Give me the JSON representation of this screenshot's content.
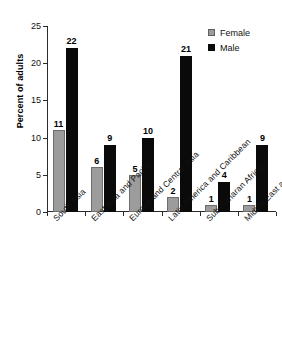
{
  "chart_data": {
    "type": "bar",
    "title": "",
    "xlabel": "",
    "ylabel": "Percent of adults",
    "ylim": [
      0,
      25
    ],
    "yticks": [
      0,
      5,
      10,
      15,
      20,
      25
    ],
    "grid": false,
    "legend_position": "top-right",
    "categories": [
      "South Asia",
      "East Asia and Pacific",
      "Europe and Central Asia",
      "Latin America and Caribbean",
      "Sub-Saharan Africa",
      "Middle East and N. Africa"
    ],
    "series": [
      {
        "name": "Female",
        "color": "#9c9c9c",
        "values": [
          11,
          6,
          5,
          2,
          1,
          1
        ]
      },
      {
        "name": "Male",
        "color": "#0a0a0a",
        "values": [
          22,
          9,
          10,
          21,
          4,
          9
        ]
      }
    ]
  },
  "legend": {
    "items": [
      {
        "label": "Female",
        "swatch": "female"
      },
      {
        "label": "Male",
        "swatch": "male"
      }
    ]
  }
}
